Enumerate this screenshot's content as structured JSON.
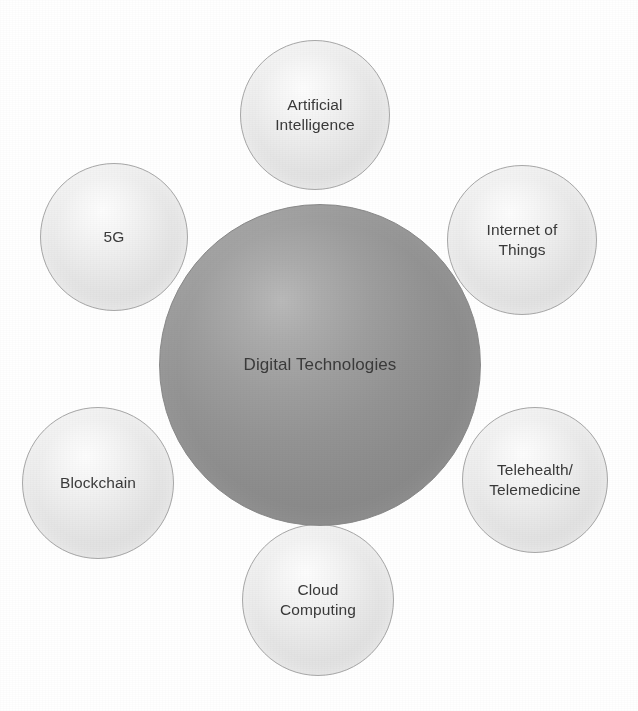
{
  "diagram": {
    "type": "hub-and-spoke",
    "background_color": "#ffffff",
    "hub": {
      "label": "Digital Technologies",
      "center_x": 320,
      "center_y": 365,
      "diameter": 322,
      "fill_color": "#949494",
      "text_color": "#3a3a3a"
    },
    "satellites": [
      {
        "id": "artificial-intelligence",
        "label": "Artificial\nIntelligence",
        "position": "top",
        "center_x": 315,
        "center_y": 115,
        "diameter": 150,
        "fill_color": "#eaeaea",
        "text_color": "#393939"
      },
      {
        "id": "internet-of-things",
        "label": "Internet of\nThings",
        "position": "top-right",
        "center_x": 522,
        "center_y": 240,
        "diameter": 150,
        "fill_color": "#eaeaea",
        "text_color": "#393939"
      },
      {
        "id": "telehealth-telemedicine",
        "label": "Telehealth/\nTelemedicine",
        "position": "bottom-right",
        "center_x": 535,
        "center_y": 480,
        "diameter": 146,
        "fill_color": "#eaeaea",
        "text_color": "#393939"
      },
      {
        "id": "cloud-computing",
        "label": "Cloud\nComputing",
        "position": "bottom",
        "center_x": 318,
        "center_y": 600,
        "diameter": 152,
        "fill_color": "#eaeaea",
        "text_color": "#393939"
      },
      {
        "id": "blockchain",
        "label": "Blockchain",
        "position": "bottom-left",
        "center_x": 98,
        "center_y": 483,
        "diameter": 152,
        "fill_color": "#eaeaea",
        "text_color": "#393939"
      },
      {
        "id": "5g",
        "label": "5G",
        "position": "top-left",
        "center_x": 114,
        "center_y": 237,
        "diameter": 148,
        "fill_color": "#eaeaea",
        "text_color": "#393939"
      }
    ]
  }
}
